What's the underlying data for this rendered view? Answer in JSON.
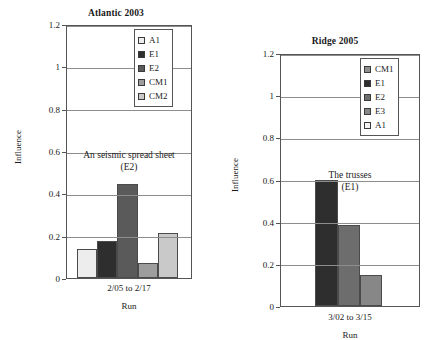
{
  "chart_data": [
    {
      "id": "atlantic-2003",
      "type": "bar",
      "title": "Atlantic 2003",
      "xlabel": "Run",
      "ylabel": "Influence",
      "categories": [
        "2/05 to 2/17"
      ],
      "ylim": [
        0,
        1.2
      ],
      "yticks": [
        "0",
        "0.2",
        "0.4",
        "0.6",
        "0.8",
        "1",
        "1.2"
      ],
      "ytick_values": [
        0,
        0.2,
        0.4,
        0.6,
        0.8,
        1,
        1.2
      ],
      "grid": true,
      "legend_position": "top-right",
      "annotation": [
        "An seismic spread sheet",
        "(E2)"
      ],
      "series": [
        {
          "name": "A1",
          "values": [
            0.135
          ],
          "color": "#ededed"
        },
        {
          "name": "E1",
          "values": [
            0.175
          ],
          "color": "#2e2e2e"
        },
        {
          "name": "E2",
          "values": [
            0.445
          ],
          "color": "#5a5a5a"
        },
        {
          "name": "CM1",
          "values": [
            0.07
          ],
          "color": "#9d9d9d"
        },
        {
          "name": "CM2",
          "values": [
            0.215
          ],
          "color": "#c9c9c9"
        }
      ]
    },
    {
      "id": "ridge-2005",
      "type": "bar",
      "title": "Ridge 2005",
      "xlabel": "Run",
      "ylabel": "Influence",
      "categories": [
        "3/02 to 3/15"
      ],
      "ylim": [
        0,
        1.2
      ],
      "yticks": [
        "0",
        "0.2",
        "0.4",
        "0.6",
        "0.8",
        "1",
        "1.2"
      ],
      "ytick_values": [
        0,
        0.2,
        0.4,
        0.6,
        0.8,
        1,
        1.2
      ],
      "grid": true,
      "legend_position": "top-right",
      "annotation": [
        "The trusses",
        "(E1)"
      ],
      "series": [
        {
          "name": "CM1",
          "values": [
            0.0
          ],
          "color": "#8f8f8f"
        },
        {
          "name": "E1",
          "values": [
            0.6
          ],
          "color": "#2e2e2e"
        },
        {
          "name": "E2",
          "values": [
            0.385
          ],
          "color": "#6d6d6d"
        },
        {
          "name": "E3",
          "values": [
            0.145
          ],
          "color": "#878787"
        },
        {
          "name": "A1",
          "values": [
            0.0
          ],
          "color": "#f4f4f4"
        }
      ]
    }
  ],
  "charts": {
    "left": {
      "title": "Atlantic 2003",
      "ylabel": "Influence",
      "xlabel": "Run",
      "xtick": "2/05 to 2/17",
      "annotation_line1": "An seismic spread sheet",
      "annotation_line2": "(E2)",
      "yticks": [
        {
          "label": "1.2"
        },
        {
          "label": "1"
        },
        {
          "label": "0.8"
        },
        {
          "label": "0.6"
        },
        {
          "label": "0.4"
        },
        {
          "label": "0.2"
        },
        {
          "label": "0"
        }
      ],
      "legend": [
        {
          "label": "A1"
        },
        {
          "label": "E1"
        },
        {
          "label": "E2"
        },
        {
          "label": "CM1"
        },
        {
          "label": "CM2"
        }
      ]
    },
    "right": {
      "title": "Ridge 2005",
      "ylabel": "Influence",
      "xlabel": "Run",
      "xtick": "3/02 to 3/15",
      "annotation_line1": "The trusses",
      "annotation_line2": "(E1)",
      "yticks": [
        {
          "label": "1.2"
        },
        {
          "label": "1"
        },
        {
          "label": "0.8"
        },
        {
          "label": "0.6"
        },
        {
          "label": "0.4"
        },
        {
          "label": "0.2"
        },
        {
          "label": "0"
        }
      ],
      "legend": [
        {
          "label": "CM1"
        },
        {
          "label": "E1"
        },
        {
          "label": "E2"
        },
        {
          "label": "E3"
        },
        {
          "label": "A1"
        }
      ]
    }
  }
}
